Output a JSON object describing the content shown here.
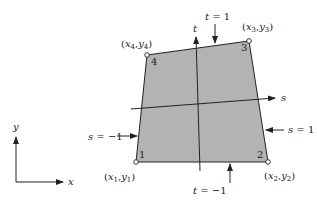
{
  "figure": {
    "type": "isoparametric quadrilateral element mapping diagram",
    "colors": {
      "element_fill": "#b3b3b3",
      "line": "#222222",
      "background": "#ffffff"
    },
    "global_axes": {
      "x_label": "x",
      "y_label": "y"
    },
    "local_axes": {
      "s_label": "s",
      "t_label": "t"
    },
    "nodes": [
      {
        "id": "1",
        "label": "(x1,y1)",
        "base": "x",
        "sub": "1",
        "base2": "y",
        "sub2": "1"
      },
      {
        "id": "2",
        "label": "(x2,y2)",
        "base": "x",
        "sub": "2",
        "base2": "y",
        "sub2": "2"
      },
      {
        "id": "3",
        "label": "(x3,y3)",
        "base": "x",
        "sub": "3",
        "base2": "y",
        "sub2": "3"
      },
      {
        "id": "4",
        "label": "(x4,y4)",
        "base": "x",
        "sub": "4",
        "base2": "y",
        "sub2": "4"
      }
    ],
    "edge_annotations": {
      "top": "t = 1",
      "bottom": "t = −1",
      "left": "s = −1",
      "right": "s = 1"
    }
  }
}
